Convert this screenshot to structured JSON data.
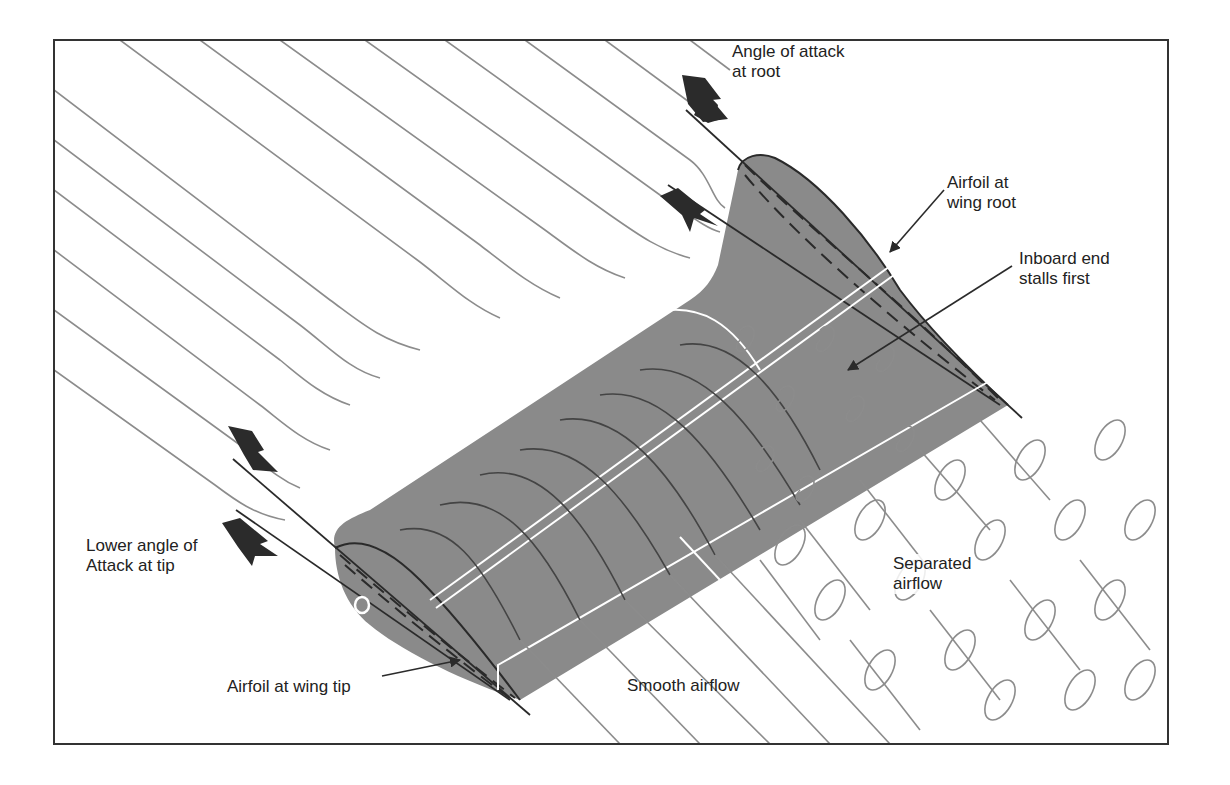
{
  "figure": {
    "type": "wing-stall-progression-diagram",
    "colors": {
      "wing_fill": "#8a8a8a",
      "streamline": "#8c8c8c",
      "outline": "#2a2a2a",
      "frame": "#333333",
      "highlight": "#ffffff",
      "arrow": "#2b2b2b"
    }
  },
  "labels": {
    "angle_root": {
      "line1": "Angle of attack",
      "line2": "at root"
    },
    "airfoil_root": {
      "line1": "Airfoil at",
      "line2": "wing root"
    },
    "inboard_stall": {
      "line1": "Inboard end",
      "line2": "stalls first"
    },
    "lower_angle_tip": {
      "line1": "Lower angle of",
      "line2": "Attack at tip"
    },
    "airfoil_tip": {
      "line1": "Airfoil at wing tip"
    },
    "smooth_airflow": {
      "line1": "Smooth airflow"
    },
    "separated_airflow": {
      "line1": "Separated",
      "line2": "airflow"
    }
  },
  "icons": {
    "root_arrow_down": "block-arrow-down-icon",
    "root_arrow_up": "block-arrow-up-icon",
    "tip_arrow_down": "block-arrow-down-icon",
    "tip_arrow_up": "block-arrow-up-icon"
  }
}
